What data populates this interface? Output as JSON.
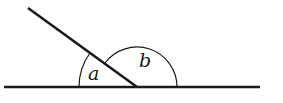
{
  "diagram": {
    "type": "angles-on-a-straight-line",
    "stroke_color": "#1a1a1a",
    "background": "#ffffff",
    "baseline": {
      "x1": 4,
      "y1": 87,
      "x2": 260,
      "y2": 87
    },
    "ray": {
      "x1": 28,
      "y1": 8,
      "x2": 137,
      "y2": 87
    },
    "vertex": {
      "x": 137,
      "y": 87
    },
    "angles": [
      {
        "name": "a",
        "label": "a",
        "arc_radius": 58,
        "label_x": 87,
        "label_y": 80
      },
      {
        "name": "b",
        "label": "b",
        "arc_radius": 40,
        "label_x": 140,
        "label_y": 67
      }
    ]
  }
}
